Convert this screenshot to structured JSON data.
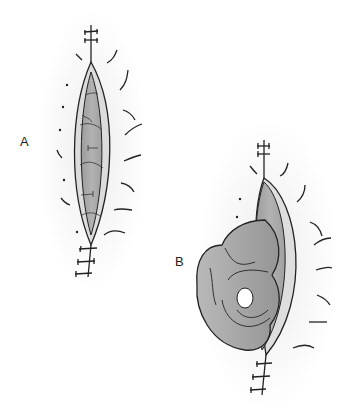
{
  "figure": {
    "panels": [
      {
        "id": "A",
        "label": "A",
        "description": "Sutured wound with elliptical opening exposing tissue"
      },
      {
        "id": "B",
        "label": "B",
        "description": "Wound with eviscerated bowel loops protruding"
      }
    ],
    "colors": {
      "background": "#ffffff",
      "halo": "#f1f1f1",
      "skin_edge": "#d9d9d9",
      "inner_tissue": "#a9a9a9",
      "bowel": "#a6a6a6",
      "outline": "#222222"
    }
  }
}
